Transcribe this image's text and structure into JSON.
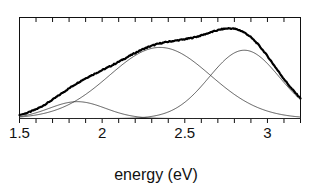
{
  "chart_data": {
    "type": "line",
    "title": "",
    "subtitle": "",
    "xlabel": "energy (eV)",
    "ylabel": "",
    "xlim": [
      1.5,
      3.2
    ],
    "ylim": [
      0,
      1.08
    ],
    "grid": false,
    "legend": "none",
    "x_tick_labels": [
      "1.5",
      "2",
      "2.5",
      "3"
    ],
    "x_tick_values": [
      1.5,
      2.0,
      2.5,
      3.0
    ],
    "x_minor_tick_step": 0.1,
    "y_axis_visible": false,
    "frame": "box",
    "annotations": [],
    "series": [
      {
        "name": "measured-spectrum",
        "role": "data",
        "style": "thick-solid-with-noise",
        "color": "#000000",
        "linewidth": 2.2,
        "description": "sum of the three gaussian components, noisy experimental trace",
        "x": [
          1.5,
          1.55,
          1.6,
          1.65,
          1.7,
          1.75,
          1.8,
          1.85,
          1.9,
          1.95,
          2.0,
          2.05,
          2.1,
          2.15,
          2.2,
          2.25,
          2.3,
          2.35,
          2.4,
          2.45,
          2.5,
          2.55,
          2.6,
          2.65,
          2.7,
          2.75,
          2.8,
          2.85,
          2.9,
          2.95,
          3.0,
          3.05,
          3.1,
          3.15,
          3.2
        ],
        "y": [
          0.01,
          0.03,
          0.07,
          0.12,
          0.18,
          0.25,
          0.31,
          0.35,
          0.38,
          0.42,
          0.47,
          0.54,
          0.61,
          0.68,
          0.73,
          0.77,
          0.79,
          0.8,
          0.8,
          0.79,
          0.78,
          0.78,
          0.79,
          0.82,
          0.87,
          0.93,
          0.98,
          1.0,
          0.97,
          0.89,
          0.77,
          0.62,
          0.47,
          0.33,
          0.24
        ]
      },
      {
        "name": "gaussian-component-1",
        "role": "fit-component",
        "style": "thin-solid",
        "color": "#333333",
        "linewidth": 0.8,
        "center": 1.85,
        "amplitude": 0.18,
        "fwhm": 0.4
      },
      {
        "name": "gaussian-component-2",
        "role": "fit-component",
        "style": "thin-solid",
        "color": "#333333",
        "linewidth": 0.8,
        "center": 2.35,
        "amplitude": 0.76,
        "fwhm": 0.72
      },
      {
        "name": "gaussian-component-3",
        "role": "fit-component",
        "style": "thin-solid",
        "color": "#333333",
        "linewidth": 0.8,
        "center": 2.86,
        "amplitude": 0.73,
        "fwhm": 0.5
      }
    ]
  },
  "axis": {
    "x_title": "energy (eV)",
    "labels": [
      {
        "text": "1.5",
        "value": 1.5
      },
      {
        "text": "2",
        "value": 2.0
      },
      {
        "text": "2.5",
        "value": 2.5
      },
      {
        "text": "3",
        "value": 3.0
      }
    ]
  }
}
